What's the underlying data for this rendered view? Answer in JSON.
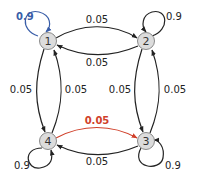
{
  "diagram": {
    "type": "markov-chain",
    "colors": {
      "node_fill": "#dcdcdc",
      "node_stroke": "#8a8a8a",
      "edge": "#222222",
      "highlight_self_loop": "#3a5ea8",
      "highlight_edge": "#d0402a"
    },
    "nodes": [
      {
        "id": "1",
        "label": "1"
      },
      {
        "id": "2",
        "label": "2"
      },
      {
        "id": "3",
        "label": "3"
      },
      {
        "id": "4",
        "label": "4"
      }
    ],
    "self_loops": [
      {
        "node": "1",
        "label": "0.9",
        "highlight": true
      },
      {
        "node": "2",
        "label": "0.9",
        "highlight": false
      },
      {
        "node": "3",
        "label": "0.9",
        "highlight": false
      },
      {
        "node": "4",
        "label": "0.9",
        "highlight": false
      }
    ],
    "edges": [
      {
        "from": "1",
        "to": "2",
        "label": "0.05"
      },
      {
        "from": "2",
        "to": "1",
        "label": "0.05"
      },
      {
        "from": "1",
        "to": "4",
        "label": "0.05"
      },
      {
        "from": "4",
        "to": "1",
        "label": "0.05"
      },
      {
        "from": "2",
        "to": "3",
        "label": "0.05"
      },
      {
        "from": "3",
        "to": "2",
        "label": "0.05"
      },
      {
        "from": "4",
        "to": "3",
        "label": "0.05",
        "highlight": true
      },
      {
        "from": "3",
        "to": "4",
        "label": "0.05"
      }
    ]
  }
}
